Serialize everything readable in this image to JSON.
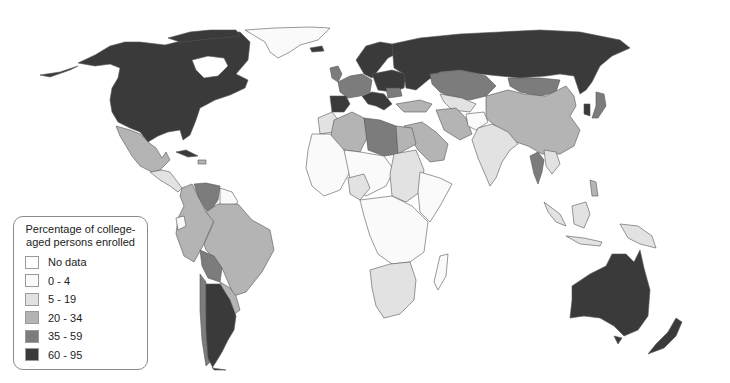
{
  "map": {
    "title": "Percentage of college-aged persons enrolled",
    "background": "#ffffff",
    "border_color": "#555555"
  },
  "legend": {
    "title": "Percentage of college-aged persons enrolled",
    "items": [
      {
        "label": "No data",
        "color": "#ffffff"
      },
      {
        "label": "0 - 4",
        "color": "#fafafa"
      },
      {
        "label": "5 - 19",
        "color": "#e2e2e2"
      },
      {
        "label": "20 - 34",
        "color": "#b4b4b4"
      },
      {
        "label": "35 - 59",
        "color": "#7c7c7c"
      },
      {
        "label": "60 - 95",
        "color": "#3a3a3a"
      }
    ]
  },
  "regions": [
    {
      "name": "North America (USA/Canada)",
      "class": "60 - 95"
    },
    {
      "name": "Greenland",
      "class": "0 - 4"
    },
    {
      "name": "Mexico",
      "class": "20 - 34"
    },
    {
      "name": "Central America",
      "class": "5 - 19"
    },
    {
      "name": "Cuba",
      "class": "60 - 95"
    },
    {
      "name": "Venezuela",
      "class": "35 - 59"
    },
    {
      "name": "Colombia / Peru",
      "class": "20 - 34"
    },
    {
      "name": "Ecuador",
      "class": "0 - 4"
    },
    {
      "name": "Guianas",
      "class": "0 - 4"
    },
    {
      "name": "Brazil",
      "class": "20 - 34"
    },
    {
      "name": "Bolivia",
      "class": "35 - 59"
    },
    {
      "name": "Chile",
      "class": "35 - 59"
    },
    {
      "name": "Argentina",
      "class": "60 - 95"
    },
    {
      "name": "Uruguay / Paraguay",
      "class": "20 - 34"
    },
    {
      "name": "Western Europe",
      "class": "35 - 59"
    },
    {
      "name": "Spain",
      "class": "60 - 95"
    },
    {
      "name": "Scandinavia / Russia",
      "class": "60 - 95"
    },
    {
      "name": "Kazakhstan",
      "class": "35 - 59"
    },
    {
      "name": "Mongolia",
      "class": "35 - 59"
    },
    {
      "name": "China",
      "class": "20 - 34"
    },
    {
      "name": "South Korea",
      "class": "60 - 95"
    },
    {
      "name": "Japan",
      "class": "35 - 59"
    },
    {
      "name": "Algeria",
      "class": "20 - 34"
    },
    {
      "name": "Libya",
      "class": "35 - 59"
    },
    {
      "name": "Egypt",
      "class": "20 - 34"
    },
    {
      "name": "Saudi Arabia / Iran",
      "class": "20 - 34"
    },
    {
      "name": "Sudan",
      "class": "5 - 19"
    },
    {
      "name": "Sub-Saharan Africa",
      "class": "0 - 4"
    },
    {
      "name": "Southern Africa",
      "class": "5 - 19"
    },
    {
      "name": "India",
      "class": "5 - 19"
    },
    {
      "name": "Thailand",
      "class": "35 - 59"
    },
    {
      "name": "Indonesia / Malaysia",
      "class": "5 - 19"
    },
    {
      "name": "Australia",
      "class": "60 - 95"
    },
    {
      "name": "New Zealand",
      "class": "60 - 95"
    }
  ]
}
